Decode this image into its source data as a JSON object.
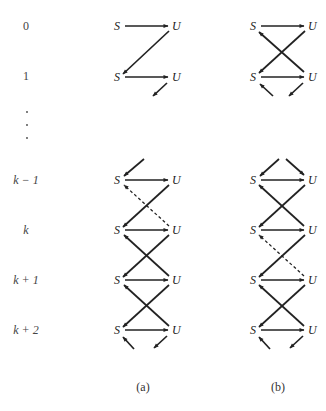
{
  "figure": {
    "row_labels": [
      {
        "id": "r0",
        "text": "0",
        "y": 30
      },
      {
        "id": "r1",
        "text": "1",
        "y": 80
      },
      {
        "id": "rkm1",
        "text": "k − 1",
        "y": 184
      },
      {
        "id": "rk",
        "text": "k",
        "y": 234
      },
      {
        "id": "rkp1",
        "text": "k + 1",
        "y": 284
      },
      {
        "id": "rkp2",
        "text": "k + 2",
        "y": 334
      }
    ],
    "ellipsis_dots": [
      112,
      125,
      138
    ],
    "node_labels": {
      "s": "S",
      "u": "U"
    },
    "panels": [
      {
        "id": "a",
        "caption": "(a)",
        "caption_x": 143,
        "sx": 118,
        "ux": 173
      },
      {
        "id": "b",
        "caption": "(b)",
        "caption_x": 278,
        "sx": 254,
        "ux": 309
      }
    ],
    "panel_a_rows": [
      "0",
      "1",
      "k−1",
      "k",
      "k+1",
      "k+2"
    ],
    "panel_b_rows": [
      "0",
      "1",
      "k−1",
      "k",
      "k+1",
      "k+2"
    ]
  }
}
